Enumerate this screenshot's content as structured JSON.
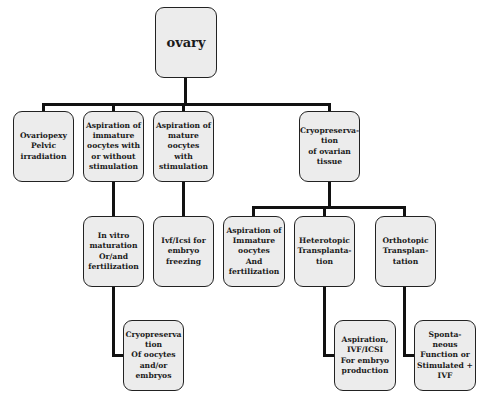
{
  "diagram": {
    "type": "tree",
    "root": {
      "id": "ovary",
      "label": "ovary"
    },
    "level1": [
      {
        "id": "ovariopexy",
        "label": "Ovariopexy\nPelvic\nirradiation"
      },
      {
        "id": "aspiration-immature",
        "label": "Aspiration of\nimmature\noocytes with\nor without\nstimulation"
      },
      {
        "id": "aspiration-mature",
        "label": "Aspiration of\nmature\noocytes\nwith\nstimulation"
      },
      {
        "id": "cryo-tissue",
        "label": "Cryopreserva-\ntion\nof ovarian\ntissue"
      }
    ],
    "level2": [
      {
        "id": "ivm",
        "parent": "aspiration-immature",
        "label": "In vitro\nmaturation\nOr/and\nfertilization"
      },
      {
        "id": "ivf-icsi-freezing",
        "parent": "aspiration-mature",
        "label": "Ivf/Icsi for\nembryo\nfreezing"
      },
      {
        "id": "aspiration-immature-fert",
        "parent": "cryo-tissue",
        "label": "Aspiration of\nImmature\noocytes\nAnd\nfertilization"
      },
      {
        "id": "heterotopic",
        "parent": "cryo-tissue",
        "label": "Heterotopic\nTransplanta-\ntion"
      },
      {
        "id": "orthotopic",
        "parent": "cryo-tissue",
        "label": "Orthotopic\nTransplan-\ntation"
      }
    ],
    "level3": [
      {
        "id": "cryo-oocytes",
        "parent": "ivm",
        "label": "Cryopreserva\ntion\nOf oocytes\nand/or\nembryos"
      },
      {
        "id": "aspiration-ivf",
        "parent": "heterotopic",
        "label": "Aspiration,\nIVF/ICSI\nFor embryo\nproduction"
      },
      {
        "id": "spontaneous",
        "parent": "orthotopic",
        "label": "Sponta-\nneous\nFunction or\nStimulated +\nIVF"
      }
    ]
  }
}
